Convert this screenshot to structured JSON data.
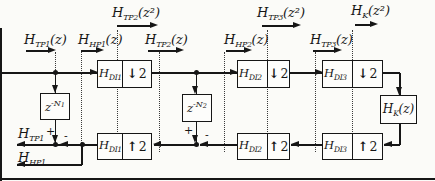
{
  "figure": {
    "point_labels": {
      "tp2_z2": {
        "h": "H",
        "sub": "TP2",
        "arg": "(z²)"
      },
      "tp3_z2": {
        "h": "H",
        "sub": "TP3",
        "arg": "(z²)"
      },
      "k_z2": {
        "h": "H",
        "sub": "K",
        "arg": "(z²)"
      },
      "tp1_z": {
        "h": "H",
        "sub": "TP1",
        "arg": "(z)"
      },
      "hp1_z": {
        "h": "H",
        "sub": "HP1",
        "arg": "(z)"
      },
      "tp2_z": {
        "h": "H",
        "sub": "TP2",
        "arg": "(z)"
      },
      "hp2_z": {
        "h": "H",
        "sub": "HP2",
        "arg": "(z)"
      },
      "tp3_z": {
        "h": "H",
        "sub": "TP3",
        "arg": "(z)"
      }
    },
    "outputs": {
      "tp1": {
        "h": "H",
        "sub": "TP1"
      },
      "hp1": {
        "h": "H",
        "sub": "HP1"
      }
    },
    "analysis_blocks": [
      {
        "filter": {
          "h": "H",
          "sub": "DI1"
        },
        "sampler": {
          "glyph": "↓",
          "factor": "2"
        }
      },
      {
        "filter": {
          "h": "H",
          "sub": "DI2"
        },
        "sampler": {
          "glyph": "↓",
          "factor": "2"
        }
      },
      {
        "filter": {
          "h": "H",
          "sub": "DI3"
        },
        "sampler": {
          "glyph": "↓",
          "factor": "2"
        }
      }
    ],
    "synthesis_blocks": [
      {
        "filter": {
          "h": "H",
          "sub": "DI1"
        },
        "sampler": {
          "glyph": "↑",
          "factor": "2"
        }
      },
      {
        "filter": {
          "h": "H",
          "sub": "DI2"
        },
        "sampler": {
          "glyph": "↑",
          "factor": "2"
        }
      },
      {
        "filter": {
          "h": "H",
          "sub": "DI3"
        },
        "sampler": {
          "glyph": "↑",
          "factor": "2"
        }
      }
    ],
    "delay_blocks": [
      {
        "base": "z",
        "exp": "-N",
        "expsub": "1"
      },
      {
        "base": "z",
        "exp": "-N",
        "expsub": "2"
      }
    ],
    "kernel_block": {
      "h": "H",
      "sub": "K",
      "arg": "(z)"
    },
    "adders": [
      {
        "plus": "+",
        "minus": "-"
      },
      {
        "plus": "+",
        "minus": "-"
      }
    ]
  }
}
